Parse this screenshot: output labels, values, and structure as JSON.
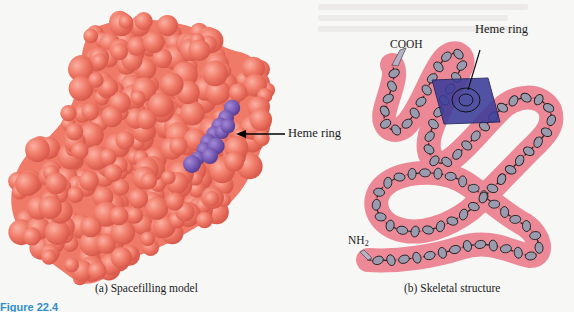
{
  "figure": {
    "label": "Figure 22.4",
    "panels": [
      {
        "id": "a",
        "caption": "(a) Spacefilling model",
        "annotations": [
          {
            "text": "Heme ring",
            "arrow": "left",
            "color": "#000000"
          }
        ],
        "colors": {
          "protein": "#f07a68",
          "heme": "#7f5fb8"
        }
      },
      {
        "id": "b",
        "caption": "(b) Skeletal structure",
        "annotations": [
          {
            "text": "Heme ring",
            "pointer": "line"
          },
          {
            "text": "COOH"
          },
          {
            "text": "NH",
            "subscript": "2"
          }
        ],
        "colors": {
          "tube": "#ec7f8e",
          "heme": "#3c3c9a",
          "helix": "#9b9bb0"
        }
      }
    ]
  }
}
